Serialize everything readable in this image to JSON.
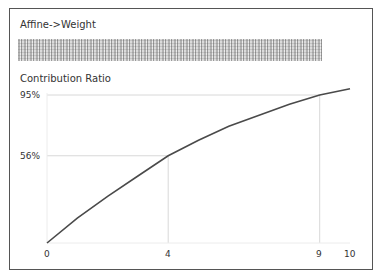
{
  "title": "Affine->Weight",
  "redacted_label": "",
  "chart_data": {
    "type": "line",
    "title": "Affine->Weight",
    "ylabel": "Contribution Ratio",
    "xlabel": "",
    "x": [
      0,
      1,
      2,
      3,
      4,
      5,
      6,
      7,
      8,
      9,
      10
    ],
    "values": [
      0,
      16,
      30,
      43,
      56,
      66,
      75,
      82,
      89,
      95,
      99
    ],
    "ytick_labels": [
      "95%",
      "56%"
    ],
    "yticks": [
      95,
      56
    ],
    "xtick_labels": [
      "0",
      "4",
      "9",
      "10"
    ],
    "xticks": [
      0,
      4,
      9,
      10
    ],
    "reference_lines": [
      {
        "x": 4,
        "y": 56
      },
      {
        "x": 9,
        "y": 95
      }
    ],
    "xlim": [
      0,
      10
    ],
    "ylim": [
      0,
      100
    ],
    "grid": false,
    "line_color": "#4a4a4a"
  }
}
